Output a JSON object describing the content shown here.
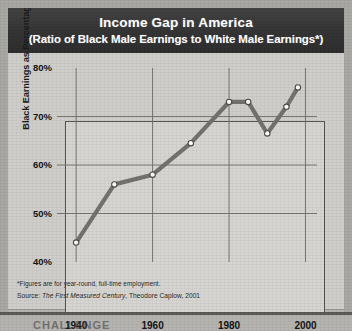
{
  "header": {
    "title": "Income Gap in America",
    "subtitle": "(Ratio of Black Male Earnings to White Male Earnings*)",
    "background_color": "#3a3a3a",
    "text_color": "#ffffff"
  },
  "notes": {
    "footnote": "*Figures are for year-round, full-time employment.",
    "source_prefix": "Source: ",
    "source_title": "The First Measured Century",
    "source_rest": ", Theodore Caplow, 2001"
  },
  "bottom_banner": {
    "partial_text": "CHALLENGE"
  },
  "chart_data": {
    "type": "line",
    "title": "Income Gap in America",
    "subtitle": "(Ratio of Black Male Earnings to White Male Earnings*)",
    "xlabel": "",
    "ylabel": "Black Earnings as Percentage of White Earnings",
    "xlim": [
      1935,
      2003
    ],
    "ylim": [
      40,
      80
    ],
    "xticks": [
      1940,
      1960,
      1980,
      2000
    ],
    "xtick_labels": [
      "1940",
      "1960",
      "1980",
      "2000"
    ],
    "yticks": [
      40,
      50,
      60,
      70,
      80
    ],
    "ytick_labels": [
      "40%",
      "50%",
      "60%",
      "70%",
      "80%"
    ],
    "grid": true,
    "grid_axis": "both",
    "legend": false,
    "line_color": "#73726d",
    "marker": "circle-open",
    "marker_face_color": "#ffffff",
    "x": [
      1940,
      1950,
      1960,
      1970,
      1980,
      1985,
      1990,
      1995,
      1998
    ],
    "values": [
      44.0,
      56.0,
      58.0,
      64.5,
      73.0,
      73.0,
      66.5,
      72.0,
      76.0
    ],
    "points": [
      {
        "x": 1940,
        "y": 44.0
      },
      {
        "x": 1950,
        "y": 56.0
      },
      {
        "x": 1960,
        "y": 58.0
      },
      {
        "x": 1970,
        "y": 64.5
      },
      {
        "x": 1980,
        "y": 73.0
      },
      {
        "x": 1985,
        "y": 73.0
      },
      {
        "x": 1990,
        "y": 66.5
      },
      {
        "x": 1995,
        "y": 72.0
      },
      {
        "x": 1998,
        "y": 76.0
      }
    ]
  }
}
